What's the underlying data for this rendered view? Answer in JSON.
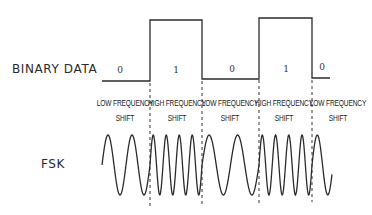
{
  "diagram": {
    "rows": {
      "binary_label": "BINARY DATA",
      "fsk_label": "FSK"
    },
    "bits": [
      {
        "value": "0",
        "level": "low"
      },
      {
        "value": "1",
        "level": "high"
      },
      {
        "value": "0",
        "level": "low"
      },
      {
        "value": "1",
        "level": "high"
      },
      {
        "value": "0",
        "level": "low"
      }
    ],
    "shifts": [
      {
        "line1": "LOW FREQUENCY",
        "line2": "SHIFT"
      },
      {
        "line1": "HIGH FREQUENCY",
        "line2": "SHIFT"
      },
      {
        "line1": "LOW FREQUENCY",
        "line2": "SHIFT"
      },
      {
        "line1": "HIGH FREQUENCY",
        "line2": "SHIFT"
      },
      {
        "line1": "LOW FREQUENCY",
        "line2": "SHIFT"
      }
    ],
    "segment_boundaries_px": [
      102,
      150,
      202,
      259,
      312,
      332
    ],
    "waveform": {
      "low_frequency_cycles_per_segment": 2,
      "high_frequency_cycles_per_segment": 4
    },
    "colors": {
      "line": "#2b2b2b",
      "text": "#222222",
      "background": "#ffffff"
    }
  }
}
